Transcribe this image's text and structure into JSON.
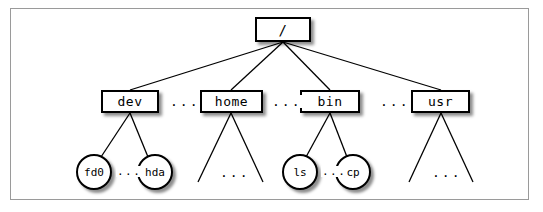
{
  "diagram": {
    "type": "tree",
    "line_color": "#000000",
    "node_fill": "#ffffff",
    "node_stroke": "#000000",
    "frame_color": "#9a9a9a",
    "background": "#ffffff"
  },
  "nodes": {
    "root": {
      "label": "/",
      "shape": "rectangle",
      "x": 255,
      "y": 17,
      "w": 56,
      "h": 25
    },
    "level1": [
      {
        "label": "dev",
        "shape": "rectangle",
        "x": 101,
        "y": 90,
        "w": 58,
        "h": 23
      },
      {
        "label": "home",
        "shape": "rectangle",
        "x": 200,
        "y": 90,
        "w": 63,
        "h": 23
      },
      {
        "label": "bin",
        "shape": "rectangle",
        "x": 300,
        "y": 90,
        "w": 60,
        "h": 23
      },
      {
        "label": "usr",
        "shape": "rectangle",
        "x": 411,
        "y": 90,
        "w": 59,
        "h": 23
      }
    ],
    "level2": [
      {
        "label": "fd0",
        "shape": "circle",
        "cx": 94,
        "cy": 172,
        "r": 18,
        "parent": "dev"
      },
      {
        "label": "hda",
        "shape": "circle",
        "cx": 155,
        "cy": 172,
        "r": 18,
        "parent": "dev"
      },
      {
        "label": "ls",
        "shape": "circle",
        "cx": 300,
        "cy": 172,
        "r": 18,
        "parent": "bin"
      },
      {
        "label": "cp",
        "shape": "circle",
        "cx": 353,
        "cy": 172,
        "r": 18,
        "parent": "bin"
      }
    ]
  },
  "ellipses": {
    "between_dev_home": {
      "text": "...",
      "x": 169,
      "y": 95
    },
    "between_home_bin": {
      "text": "...",
      "x": 271,
      "y": 95
    },
    "between_bin_usr": {
      "text": "...",
      "x": 379,
      "y": 95
    },
    "between_fd0_hda": {
      "text": "...",
      "x": 118,
      "y": 166
    },
    "between_ls_cp": {
      "text": "...",
      "x": 322,
      "y": 166
    },
    "under_home": {
      "text": "...",
      "x": 219,
      "y": 166
    },
    "under_usr": {
      "text": "...",
      "x": 431,
      "y": 166
    }
  },
  "edges": [
    {
      "from": "/",
      "to": "dev"
    },
    {
      "from": "/",
      "to": "home"
    },
    {
      "from": "/",
      "to": "bin"
    },
    {
      "from": "/",
      "to": "usr"
    },
    {
      "from": "dev",
      "to": "fd0"
    },
    {
      "from": "dev",
      "to": "hda"
    },
    {
      "from": "home",
      "to": "child-left"
    },
    {
      "from": "home",
      "to": "child-right"
    },
    {
      "from": "bin",
      "to": "ls"
    },
    {
      "from": "bin",
      "to": "cp"
    },
    {
      "from": "usr",
      "to": "child-left"
    },
    {
      "from": "usr",
      "to": "child-right"
    }
  ]
}
